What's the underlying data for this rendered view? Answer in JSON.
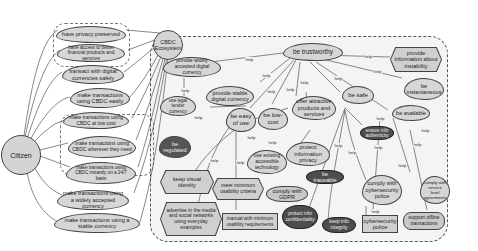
{
  "diagram": {
    "type": "iStar goal model",
    "actors": {
      "citizen": {
        "label": "Citizen"
      },
      "ecosystem": {
        "label": "CBDC Ecosystem"
      }
    },
    "citizen_goals": [
      {
        "id": "c1",
        "label": "have privacy preserved"
      },
      {
        "id": "c2",
        "label": "have access to better financial products and services"
      },
      {
        "id": "c3",
        "label": "transact with digital currencies safely"
      },
      {
        "id": "c4",
        "label": "make transactions using CBDC easily"
      },
      {
        "id": "c5",
        "label": "make transactions using CBDC at low cost"
      },
      {
        "id": "c6",
        "label": "make transactions using CBDC wherever they need"
      },
      {
        "id": "c7",
        "label": "make transactions using CBDC instantly on a 24/7 basis"
      },
      {
        "id": "c8",
        "label": "make transactions using a widely accepted currency"
      },
      {
        "id": "c9",
        "label": "make transactions using a stable currency"
      }
    ],
    "ecosystem_nodes": {
      "be_trustworthy": "be trustworthy",
      "provide_info_instability": "provide information about instability",
      "provide_widely_accepted": "provide widely accepted digital currency",
      "provide_stable": "provide stable digital currency",
      "use_legal_tender": "use legal tender currency",
      "be_easy_of_use": "be easy of use",
      "be_low_cost": "be low-cost",
      "offer_attractive": "offer attractive products and services",
      "be_safe": "be safe",
      "be_instantaneous": "be instantaneous",
      "be_available": "be available",
      "be_regulated": "be regulated",
      "use_existing_tech": "use existing accessible technology",
      "protect_privacy": "protect information privacy",
      "ensure_authenticity": "ensure info authenticity",
      "keep_visual_identity": "keep visual identity",
      "meet_usability": "meet minimum usability criteria",
      "comply_gdpr": "comply with GDPR",
      "be_traceable": "be traceable",
      "comply_cyber": "comply with cybersecurity police",
      "comply_sla": "comply with service level agreements",
      "advertise": "advertise in the media and social networks using everyday examples",
      "manual_usability": "manual with minimum usability requirements",
      "protect_confidentiality": "protect info confidentiality",
      "keep_integrity": "keep info integrity",
      "cyber_police": "cybersecurity police",
      "support_offline": "support offline transactions"
    },
    "link_labels": {
      "help": "help",
      "hurt": "hurt"
    },
    "colors": {
      "node_fill": "#c9c9c9",
      "dark_node_fill": "#4d4d4d",
      "boundary_fill": "#f4f4f4",
      "line": "#444444"
    }
  }
}
